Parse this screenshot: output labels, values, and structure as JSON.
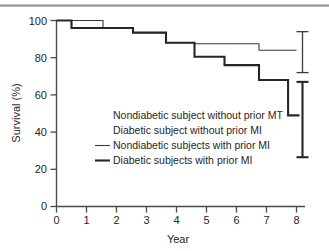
{
  "chart_data": {
    "type": "line",
    "title": "",
    "xlabel": "Year",
    "ylabel": "Survival (%)",
    "xlim": [
      0,
      8
    ],
    "ylim": [
      0,
      100
    ],
    "xticks": [
      0,
      1,
      2,
      3,
      4,
      5,
      6,
      7,
      8
    ],
    "yticks": [
      0,
      20,
      40,
      60,
      80,
      100
    ],
    "xtick_labels": [
      "0",
      "1",
      "2",
      "3",
      "4",
      "5",
      "6",
      "7",
      "8"
    ],
    "ytick_labels": [
      "0",
      "20",
      "40",
      "60",
      "80",
      "100"
    ],
    "grid": false,
    "legend_position": "center",
    "series": [
      {
        "name": "Nondiabetic subjects with prior MI",
        "style": "thin",
        "color": "#3b3b3b",
        "steps": [
          {
            "x": 0.0,
            "y": 100
          },
          {
            "x": 1.55,
            "y": 100
          },
          {
            "x": 1.55,
            "y": 96
          },
          {
            "x": 2.55,
            "y": 96
          },
          {
            "x": 2.55,
            "y": 93.5
          },
          {
            "x": 3.65,
            "y": 93.5
          },
          {
            "x": 3.65,
            "y": 88
          },
          {
            "x": 4.6,
            "y": 88
          },
          {
            "x": 4.6,
            "y": 87.5
          },
          {
            "x": 6.75,
            "y": 87.5
          },
          {
            "x": 6.75,
            "y": 84
          },
          {
            "x": 8.0,
            "y": 84
          }
        ],
        "errorbar": {
          "x": 8.2,
          "low": 72,
          "high": 94
        }
      },
      {
        "name": "Diabetic subjects with prior MI",
        "style": "thick",
        "color": "#262626",
        "steps": [
          {
            "x": 0.0,
            "y": 100
          },
          {
            "x": 0.5,
            "y": 100
          },
          {
            "x": 0.5,
            "y": 96
          },
          {
            "x": 2.55,
            "y": 96
          },
          {
            "x": 2.55,
            "y": 93.5
          },
          {
            "x": 3.65,
            "y": 93.5
          },
          {
            "x": 3.65,
            "y": 88
          },
          {
            "x": 4.6,
            "y": 88
          },
          {
            "x": 4.6,
            "y": 80.5
          },
          {
            "x": 5.6,
            "y": 80.5
          },
          {
            "x": 5.6,
            "y": 76
          },
          {
            "x": 6.75,
            "y": 76
          },
          {
            "x": 6.75,
            "y": 68
          },
          {
            "x": 7.72,
            "y": 68
          },
          {
            "x": 7.72,
            "y": 49
          },
          {
            "x": 8.1,
            "y": 49
          }
        ],
        "errorbar": {
          "x": 8.2,
          "low": 26.5,
          "high": 67
        }
      }
    ],
    "legend_entries": [
      {
        "label": "Nondiabetic subject without prior MT",
        "marker": "none"
      },
      {
        "label": "Diabetic subject without prior MI",
        "marker": "none"
      },
      {
        "label": "Nondiabetic subjects with prior MI",
        "marker": "thin-line"
      },
      {
        "label": "Diabetic subjects with prior MI",
        "marker": "thick-line"
      }
    ]
  }
}
